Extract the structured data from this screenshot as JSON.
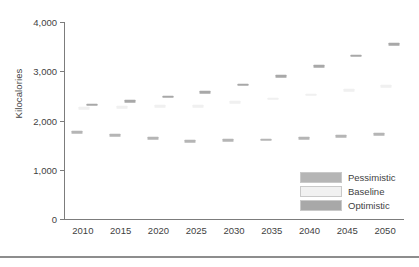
{
  "chart_data": {
    "type": "scatter",
    "title": "",
    "subtitle": "",
    "xlabel": "",
    "ylabel": "Kilocalories",
    "categories": [
      2010,
      2015,
      2020,
      2025,
      2030,
      2035,
      2040,
      2045,
      2050
    ],
    "x_tick_labels": [
      "2010",
      "2015",
      "2020",
      "2025",
      "2030",
      "2035",
      "2040",
      "2045",
      "2050"
    ],
    "y_tick_labels": [
      "0",
      "1,000",
      "2,000",
      "3,000",
      "4,000"
    ],
    "y_ticks": [
      0,
      1000,
      2000,
      3000,
      4000
    ],
    "ylim": [
      0,
      4000
    ],
    "grid": false,
    "legend_position": "bottom-right",
    "marker_style": "horizontal-dash",
    "series": [
      {
        "name": "Pessimistic",
        "color": "#b5b5b5",
        "offset": -0.45,
        "values": [
          1760,
          1705,
          1640,
          1580,
          1595,
          1610,
          1645,
          1680,
          1720
        ]
      },
      {
        "name": "Baseline",
        "color": "#f0f0f0",
        "offset": 0.1,
        "values": [
          2255,
          2275,
          2285,
          2290,
          2370,
          2440,
          2525,
          2620,
          2700
        ]
      },
      {
        "name": "Optimistic",
        "color": "#a8a8a8",
        "offset": 0.7,
        "values": [
          2320,
          2390,
          2480,
          2570,
          2730,
          2905,
          3100,
          3315,
          3555
        ]
      }
    ]
  },
  "legend": {
    "items": [
      {
        "label": "Pessimistic",
        "color": "#b5b5b5"
      },
      {
        "label": "Baseline",
        "color": "#f1f1f1"
      },
      {
        "label": "Optimistic",
        "color": "#a8a8a8"
      }
    ]
  },
  "colors": {
    "axis": "#7c7c7c",
    "text": "#3f3f3f",
    "rule": "#8d8d8d",
    "background": "#ffffff"
  }
}
